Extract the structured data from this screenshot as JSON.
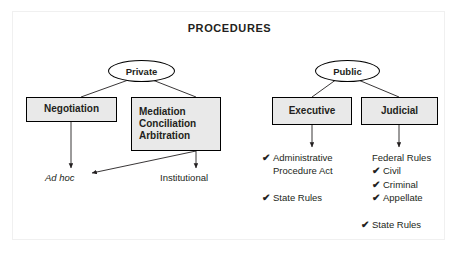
{
  "title": "PROCEDURES",
  "colors": {
    "box_fill": "#e9e9e9",
    "ellipse_fill": "#ffffff",
    "stroke": "#000000",
    "text": "#231f20",
    "frame": "#f0f0f0"
  },
  "icons": {
    "check": "✔",
    "arrowhead": "arrowhead-icon"
  },
  "branches": {
    "private": {
      "label": "Private",
      "children": [
        {
          "label": "Negotiation"
        },
        {
          "label": "Mediation\nConciliation\nArbitration",
          "line1": "Mediation",
          "line2": "Conciliation",
          "line3": "Arbitration"
        }
      ],
      "outcomes": [
        {
          "label": "Ad hoc",
          "style": "italic"
        },
        {
          "label": "Institutional",
          "style": "normal"
        }
      ]
    },
    "public": {
      "label": "Public",
      "children": [
        {
          "label": "Executive"
        },
        {
          "label": "Judicial"
        }
      ],
      "executive_list": [
        {
          "check": true,
          "text": "Administrative"
        },
        {
          "check": false,
          "text": "Procedure Act"
        },
        {
          "check": true,
          "text": "State Rules",
          "gap": true
        }
      ],
      "judicial_list": [
        {
          "check": false,
          "text": "Federal Rules",
          "indent": false
        },
        {
          "check": true,
          "text": "Civil",
          "indent": true
        },
        {
          "check": true,
          "text": "Criminal",
          "indent": true
        },
        {
          "check": true,
          "text": "Appellate",
          "indent": true
        },
        {
          "check": true,
          "text": "State Rules",
          "indent": false,
          "gap": true
        }
      ]
    }
  }
}
